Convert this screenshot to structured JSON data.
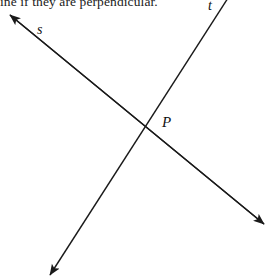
{
  "figure": {
    "width": 270,
    "height": 277,
    "background_color": "#ffffff",
    "stroke_color": "#1a1a1a",
    "question_text": "ine if they are perpendicular.",
    "point_label": "P",
    "labels": {
      "line_s": "s",
      "line_t": "t"
    },
    "lines": [
      {
        "name": "s",
        "label": "s",
        "start": {
          "x": 10,
          "y": 15
        },
        "end": {
          "x": 264,
          "y": 224
        },
        "arrow_start": true,
        "arrow_end": true
      },
      {
        "name": "t",
        "label": "t",
        "start": {
          "x": 228,
          "y": 0
        },
        "end": {
          "x": 50,
          "y": 275
        },
        "arrow_start": false,
        "arrow_end": true
      }
    ],
    "intersection": {
      "label": "P",
      "x": 148,
      "y": 133
    }
  }
}
